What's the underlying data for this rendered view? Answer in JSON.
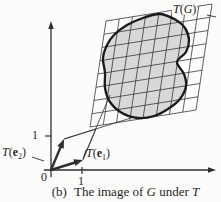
{
  "figure": {
    "caption": {
      "index": "(b)",
      "text_pre": "The image of",
      "g": "G",
      "text_mid": "under",
      "t": "T"
    },
    "labels": {
      "tg": {
        "t": "T",
        "open": "(",
        "g": "G",
        "close": ")"
      },
      "te1": {
        "t": "T",
        "open": "(",
        "e": "e",
        "sub": "1",
        "close": ")"
      },
      "te2": {
        "t": "T",
        "open": "(",
        "e": "e",
        "sub": "2",
        "close": ")"
      },
      "tick_x": "1",
      "tick_y": "1",
      "origin": "0"
    },
    "colors": {
      "ink": "#2e2e2e",
      "blob_outline": "#1a1a1a",
      "blob_fill": "#d8d8d8",
      "background": "#fcfcfb"
    },
    "geometry": {
      "x_axis": {
        "from": [
          44,
          170
        ],
        "to": [
          216,
          170
        ]
      },
      "y_axis": {
        "from": [
          51,
          177
        ],
        "to": [
          51,
          21
        ]
      },
      "origin_point": [
        51,
        170
      ],
      "tick_x": {
        "from": [
          82,
          167
        ],
        "to": [
          82,
          174
        ]
      },
      "tick_y": {
        "from": [
          45,
          136
        ],
        "to": [
          51,
          136
        ]
      },
      "te1_arrow": {
        "from": [
          51,
          170
        ],
        "to": [
          83,
          160
        ]
      },
      "te2_arrow": {
        "from": [
          51,
          170
        ],
        "to": [
          64,
          139
        ]
      },
      "unit_cell_lines": [
        {
          "from": [
            64,
            139
          ],
          "to": [
            96,
            129
          ]
        },
        {
          "from": [
            83,
            160
          ],
          "to": [
            96,
            129
          ]
        }
      ],
      "image_line_y1": {
        "from": [
          64,
          139
        ],
        "to": [
          134,
          117
        ]
      },
      "image_line_x1": {
        "from": [
          83,
          159
        ],
        "to": [
          110,
          95
        ]
      },
      "grid": {
        "bl": [
          90,
          127
        ],
        "br": [
          196,
          110
        ],
        "tl": [
          106,
          21
        ],
        "tr": [
          212,
          4
        ],
        "cells": 8
      },
      "blob": [
        [
          143,
          18
        ],
        [
          160,
          14
        ],
        [
          176,
          20
        ],
        [
          185,
          28
        ],
        [
          189,
          40
        ],
        [
          186,
          52
        ],
        [
          177,
          62
        ],
        [
          184,
          74
        ],
        [
          186,
          86
        ],
        [
          180,
          99
        ],
        [
          168,
          109
        ],
        [
          154,
          116
        ],
        [
          138,
          118
        ],
        [
          122,
          113
        ],
        [
          110,
          102
        ],
        [
          105,
          88
        ],
        [
          105,
          73
        ],
        [
          103,
          58
        ],
        [
          107,
          45
        ],
        [
          114,
          35
        ],
        [
          127,
          25
        ]
      ],
      "leaders": [
        {
          "from": [
            32,
            157
          ],
          "to": [
            44,
            161
          ]
        },
        {
          "from": [
            86,
            150
          ],
          "to": [
            83,
            159
          ]
        },
        {
          "from": [
            207,
            15
          ],
          "to": [
            216,
            17
          ]
        }
      ]
    }
  }
}
